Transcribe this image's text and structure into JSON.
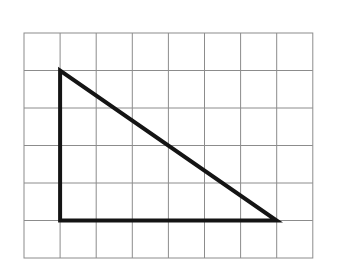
{
  "figure": {
    "background_color": "#ffffff"
  },
  "chart_data": {
    "type": "diagram",
    "title": "",
    "xlabel": "",
    "ylabel": "",
    "grid": {
      "visible": true,
      "columns": 8,
      "rows": 6,
      "cell_width_px": 36.1,
      "cell_height_px": 37.5,
      "origin_x_px": 24,
      "origin_y_px": 33,
      "line_color": "#8c8c8c",
      "line_width_px": 1,
      "border_color": "#8c8c8c",
      "border_width_px": 1
    },
    "shapes": [
      {
        "name": "right-triangle",
        "kind": "polygon",
        "closed": true,
        "stroke_color": "#141414",
        "stroke_width_px": 4,
        "fill": "none",
        "vertices_grid": [
          {
            "label": "apex",
            "col": 1,
            "row": 1
          },
          {
            "label": "right-angle",
            "col": 1,
            "row": 5
          },
          {
            "label": "base-right",
            "col": 7,
            "row": 5
          }
        ],
        "vertices_px": [
          {
            "label": "apex",
            "x": 60.1,
            "y": 70.5
          },
          {
            "label": "right-angle",
            "x": 60.1,
            "y": 220.5
          },
          {
            "label": "base-right",
            "x": 276.6,
            "y": 220.5
          }
        ],
        "edges": [
          {
            "name": "vertical-leg",
            "length_units": 4,
            "orientation": "vertical"
          },
          {
            "name": "horizontal-leg",
            "length_units": 6,
            "orientation": "horizontal"
          },
          {
            "name": "hypotenuse",
            "rise_units": -4,
            "run_units": 6,
            "slope": -0.6667
          }
        ]
      }
    ]
  }
}
